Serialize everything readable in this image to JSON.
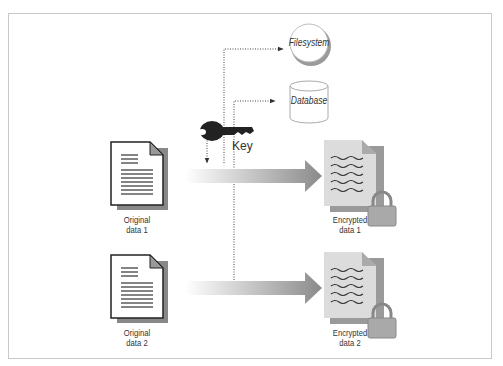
{
  "diagram": {
    "storage": {
      "filesystem": "Filesystem",
      "database": "Database"
    },
    "key_label": "Key",
    "rows": [
      {
        "original": [
          "Original",
          "data 1"
        ],
        "encrypted": [
          "Encrypted",
          "data 1"
        ]
      },
      {
        "original": [
          "Original",
          "data 2"
        ],
        "encrypted": [
          "Encrypted",
          "data 2"
        ]
      }
    ],
    "colors": {
      "frame": "#c8c8c8",
      "arrow": "#8a8a8a",
      "doc_fill": "#ffffff",
      "enc_doc_fill": "#dcdcdc",
      "lock": "#a9a9a9",
      "key": "#222222"
    }
  }
}
